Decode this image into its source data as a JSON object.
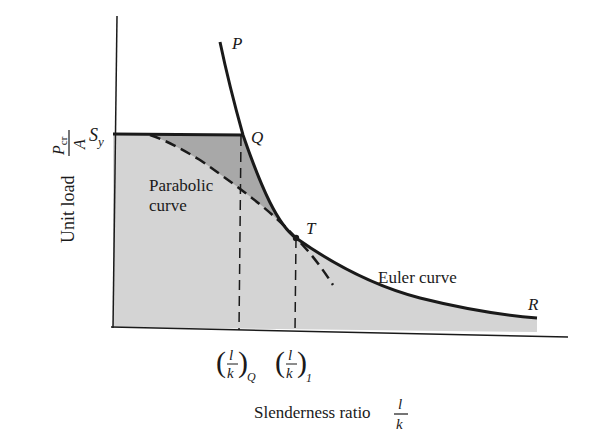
{
  "diagram": {
    "colors": {
      "background": "#ffffff",
      "ink": "#1a1a1a",
      "safe_region_fill": "#d4d4d4",
      "wedge_fill": "#a8a8a8"
    },
    "axes": {
      "y_label_text": "Unit load",
      "y_label_frac_num": "P",
      "y_label_frac_num_sub": "cr",
      "y_label_frac_den": "A",
      "x_label_text": "Slenderness ratio",
      "x_label_frac_num": "l",
      "x_label_frac_den": "k"
    },
    "points": {
      "P": "P",
      "Q": "Q",
      "T": "T",
      "R": "R",
      "Sy_main": "S",
      "Sy_sub": "y"
    },
    "curves": {
      "parabolic_line1": "Parabolic",
      "parabolic_line2": "curve",
      "euler": "Euler curve"
    },
    "x_ticks": [
      {
        "num": "l",
        "den": "k",
        "sub": "Q"
      },
      {
        "num": "l",
        "den": "k",
        "sub": "1"
      }
    ]
  }
}
